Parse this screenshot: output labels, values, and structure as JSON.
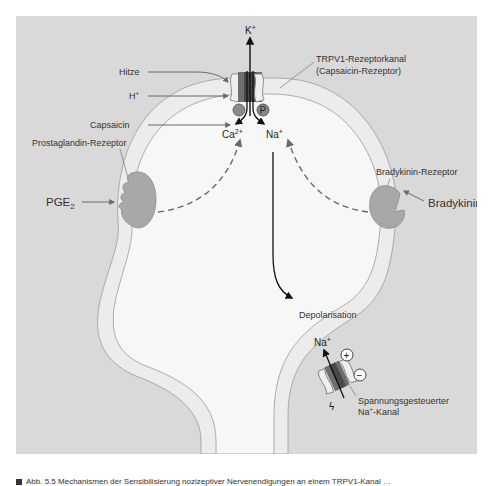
{
  "figure": {
    "colors": {
      "background_panel": "#d9d9d9",
      "membrane": "#ececec",
      "cytoplasm": "#f7f7f7",
      "receptor": "#a8a8a8",
      "channel_dark": "#6e6e6e",
      "arrow": "#555555"
    },
    "stimuli": {
      "heat": "Hitze",
      "proton": "H",
      "proton_sup": "+",
      "capsaicin": "Capsaicin",
      "pge2": "PGE",
      "pge2_sub": "2",
      "bradykinin": "Bradykinin"
    },
    "receptors": {
      "trpv1_line1": "TRPV1-Rezeptorkanal",
      "trpv1_line2": "(Capsaicin-Rezeptor)",
      "prostaglandin": "Prostaglandin-Rezeptor",
      "bradykinin": "Bradykinin-Rezeptor",
      "nav_line1": "Spannungsgesteuerter",
      "nav_line2_a": "Na",
      "nav_line2_sup": "+",
      "nav_line2_b": "-Kanal"
    },
    "ions": {
      "k": "K",
      "k_sup": "+",
      "ca": "Ca",
      "ca_sup": "2+",
      "na": "Na",
      "na_sup": "+",
      "na2": "Na",
      "na2_sup": "+"
    },
    "symbols": {
      "phospho": "P",
      "plus": "+",
      "minus": "−",
      "lightning": "ϟ"
    },
    "process": {
      "depolarisation": "Depolarisation"
    },
    "caption": "Abb. 5.5 Mechanismen der Sensibilisierung nozizeptiver Nervenendigungen an einem TRPV1-Kanal …"
  }
}
